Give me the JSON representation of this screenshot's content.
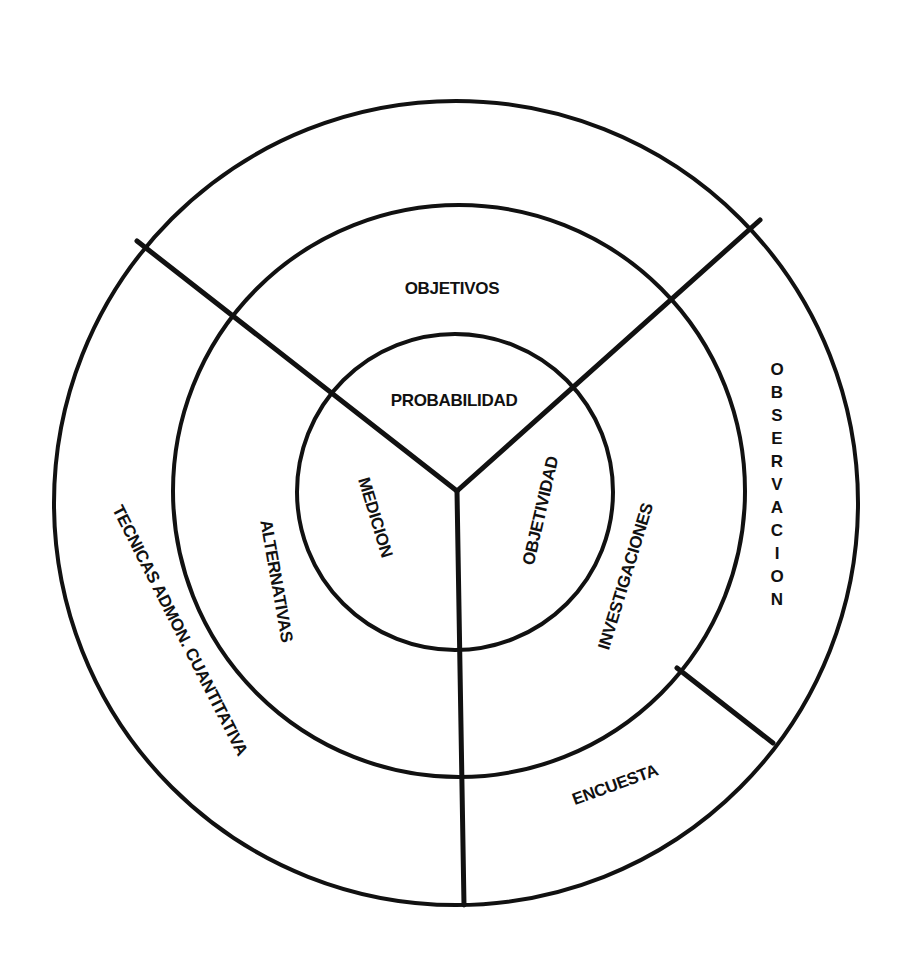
{
  "diagram": {
    "type": "concentric-sector-diagram",
    "rings": [
      {
        "name": "inner",
        "labels": {
          "top": "PROBABILIDAD",
          "left": "MEDICION",
          "right": "OBJETIVIDAD"
        }
      },
      {
        "name": "middle",
        "labels": {
          "top": "OBJETIVOS",
          "left": "ALTERNATIVAS",
          "right": "INVESTIGACIONES"
        }
      },
      {
        "name": "outer",
        "labels": {
          "left": "TECNICAS ADMON. CUANTITATIVA",
          "right": "OBSERVACION",
          "bottom_right": "ENCUESTA"
        }
      }
    ],
    "observacion_letters": [
      "O",
      "B",
      "S",
      "E",
      "R",
      "V",
      "A",
      "C",
      "I",
      "O",
      "N"
    ],
    "colors": {
      "stroke": "#111111",
      "background": "#ffffff"
    }
  }
}
